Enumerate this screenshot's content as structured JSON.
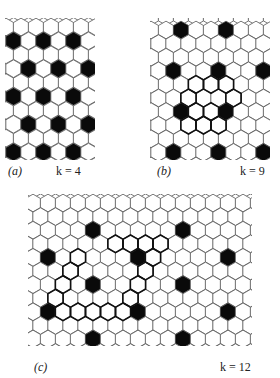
{
  "figure": {
    "panels": [
      {
        "id": "a",
        "label": "(a)",
        "k_text": "k = 4",
        "k": 4,
        "grid": {
          "x0": 6,
          "y0": 27,
          "cols": 7,
          "rows": 10,
          "cell_w": 15,
          "row_h": 13.9
        },
        "filled": [
          [
            1,
            0
          ],
          [
            1,
            2
          ],
          [
            1,
            4
          ],
          [
            3,
            1
          ],
          [
            3,
            3
          ],
          [
            3,
            5
          ],
          [
            5,
            0
          ],
          [
            5,
            2
          ],
          [
            5,
            4
          ],
          [
            7,
            1
          ],
          [
            7,
            3
          ],
          [
            7,
            5
          ],
          [
            9,
            0
          ],
          [
            9,
            2
          ],
          [
            9,
            4
          ]
        ],
        "boundary": [],
        "label_pos": {
          "x": 8,
          "y": 164
        },
        "k_pos": {
          "x": 56,
          "y": 164
        },
        "clip": {
          "x": 5,
          "y": 18,
          "w": 90,
          "h": 142
        }
      },
      {
        "id": "b",
        "label": "(b)",
        "k_text": "k = 9",
        "k": 9,
        "grid": {
          "x0": 151,
          "y0": 30,
          "cols": 9,
          "rows": 10,
          "cell_w": 15,
          "row_h": 13.6
        },
        "filled": [
          [
            0,
            2
          ],
          [
            0,
            5
          ],
          [
            3,
            1
          ],
          [
            3,
            4
          ],
          [
            3,
            7
          ],
          [
            6,
            2
          ],
          [
            6,
            5
          ],
          [
            9,
            1
          ],
          [
            9,
            4
          ],
          [
            9,
            7
          ]
        ],
        "boundary": [
          [
            4,
            3
          ],
          [
            4,
            4
          ],
          [
            4,
            5
          ],
          [
            5,
            2
          ],
          [
            5,
            5
          ],
          [
            6,
            3
          ],
          [
            6,
            4
          ],
          [
            7,
            2
          ],
          [
            7,
            3
          ],
          [
            7,
            4
          ]
        ],
        "label_pos": {
          "x": 157,
          "y": 164
        },
        "k_pos": {
          "x": 240,
          "y": 164
        },
        "clip": {
          "x": 150,
          "y": 18,
          "w": 120,
          "h": 142
        }
      },
      {
        "id": "c",
        "label": "(c)",
        "k_text": "k = 12",
        "k": 12,
        "grid": {
          "x0": 33,
          "y0": 203,
          "cols": 15,
          "rows": 11,
          "cell_w": 15,
          "row_h": 13.6
        },
        "filled": [
          [
            2,
            4
          ],
          [
            2,
            10
          ],
          [
            4,
            1
          ],
          [
            4,
            7
          ],
          [
            4,
            13
          ],
          [
            6,
            4
          ],
          [
            6,
            10
          ],
          [
            8,
            1
          ],
          [
            8,
            7
          ],
          [
            8,
            13
          ],
          [
            10,
            4
          ],
          [
            10,
            10
          ]
        ],
        "boundary": [
          [
            3,
            5
          ],
          [
            3,
            6
          ],
          [
            3,
            7
          ],
          [
            3,
            8
          ],
          [
            4,
            3
          ],
          [
            4,
            8
          ],
          [
            5,
            2
          ],
          [
            5,
            7
          ],
          [
            6,
            2
          ],
          [
            6,
            7
          ],
          [
            7,
            1
          ],
          [
            7,
            6
          ],
          [
            8,
            2
          ],
          [
            8,
            3
          ],
          [
            8,
            4
          ],
          [
            8,
            5
          ],
          [
            8,
            6
          ]
        ],
        "label_pos": {
          "x": 34,
          "y": 360
        },
        "k_pos": {
          "x": 220,
          "y": 360
        },
        "clip": {
          "x": 28,
          "y": 194,
          "w": 224,
          "h": 152
        }
      }
    ],
    "colors": {
      "line": "#555555",
      "fill": "#0a0a0a",
      "background": "#ffffff",
      "boundary": "#111111"
    }
  }
}
